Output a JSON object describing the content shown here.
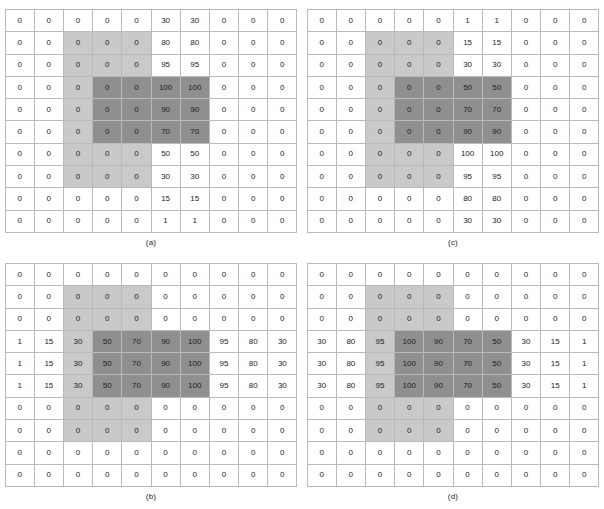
{
  "figure": {
    "title": "",
    "panel_count": 4,
    "grid_rows": 10,
    "grid_cols": 10,
    "colors": {
      "cell_background": "#ffffff",
      "shade_light": "#c9c9c9",
      "shade_dark": "#8f8f8f",
      "grid_line": "#b9b9b9",
      "text": "#1b1b1b"
    }
  },
  "chart_data": {
    "type": "heatmap",
    "title": "",
    "xlabel": "",
    "ylabel": "",
    "grid": true,
    "legend": "none",
    "rows": 10,
    "cols": 10,
    "shading_levels": [
      {
        "name": "none",
        "color": "#ffffff"
      },
      {
        "name": "light",
        "color": "#c9c9c9"
      },
      {
        "name": "dark",
        "color": "#8f8f8f"
      }
    ],
    "shade_regions": {
      "light": {
        "row_start": 1,
        "row_end": 7,
        "col_start": 2,
        "col_end": 4
      },
      "dark": {
        "row_start": 3,
        "row_end": 5,
        "col_start": 3,
        "col_end": 6
      }
    },
    "panels": [
      {
        "label": "(a)",
        "position": "top-left",
        "values": [
          [
            0,
            0,
            0,
            0,
            0,
            30,
            30,
            0,
            0,
            0
          ],
          [
            0,
            0,
            0,
            0,
            0,
            80,
            80,
            0,
            0,
            0
          ],
          [
            0,
            0,
            0,
            0,
            0,
            95,
            95,
            0,
            0,
            0
          ],
          [
            0,
            0,
            0,
            0,
            0,
            100,
            100,
            0,
            0,
            0
          ],
          [
            0,
            0,
            0,
            0,
            0,
            90,
            90,
            0,
            0,
            0
          ],
          [
            0,
            0,
            0,
            0,
            0,
            70,
            70,
            0,
            0,
            0
          ],
          [
            0,
            0,
            0,
            0,
            0,
            50,
            50,
            0,
            0,
            0
          ],
          [
            0,
            0,
            0,
            0,
            0,
            30,
            30,
            0,
            0,
            0
          ],
          [
            0,
            0,
            0,
            0,
            0,
            15,
            15,
            0,
            0,
            0
          ],
          [
            0,
            0,
            0,
            0,
            0,
            1,
            1,
            0,
            0,
            0
          ]
        ]
      },
      {
        "label": "(b)",
        "position": "bottom-left",
        "values": [
          [
            0,
            0,
            0,
            0,
            0,
            0,
            0,
            0,
            0,
            0
          ],
          [
            0,
            0,
            0,
            0,
            0,
            0,
            0,
            0,
            0,
            0
          ],
          [
            0,
            0,
            0,
            0,
            0,
            0,
            0,
            0,
            0,
            0
          ],
          [
            1,
            15,
            30,
            50,
            70,
            90,
            100,
            95,
            80,
            30
          ],
          [
            1,
            15,
            30,
            50,
            70,
            90,
            100,
            95,
            80,
            30
          ],
          [
            1,
            15,
            30,
            50,
            70,
            90,
            100,
            95,
            80,
            30
          ],
          [
            0,
            0,
            0,
            0,
            0,
            0,
            0,
            0,
            0,
            0
          ],
          [
            0,
            0,
            0,
            0,
            0,
            0,
            0,
            0,
            0,
            0
          ],
          [
            0,
            0,
            0,
            0,
            0,
            0,
            0,
            0,
            0,
            0
          ],
          [
            0,
            0,
            0,
            0,
            0,
            0,
            0,
            0,
            0,
            0
          ]
        ]
      },
      {
        "label": "(c)",
        "position": "top-right",
        "values": [
          [
            0,
            0,
            0,
            0,
            0,
            1,
            1,
            0,
            0,
            0
          ],
          [
            0,
            0,
            0,
            0,
            0,
            15,
            15,
            0,
            0,
            0
          ],
          [
            0,
            0,
            0,
            0,
            0,
            30,
            30,
            0,
            0,
            0
          ],
          [
            0,
            0,
            0,
            0,
            0,
            50,
            50,
            0,
            0,
            0
          ],
          [
            0,
            0,
            0,
            0,
            0,
            70,
            70,
            0,
            0,
            0
          ],
          [
            0,
            0,
            0,
            0,
            0,
            90,
            90,
            0,
            0,
            0
          ],
          [
            0,
            0,
            0,
            0,
            0,
            100,
            100,
            0,
            0,
            0
          ],
          [
            0,
            0,
            0,
            0,
            0,
            95,
            95,
            0,
            0,
            0
          ],
          [
            0,
            0,
            0,
            0,
            0,
            80,
            80,
            0,
            0,
            0
          ],
          [
            0,
            0,
            0,
            0,
            0,
            30,
            30,
            0,
            0,
            0
          ]
        ]
      },
      {
        "label": "(d)",
        "position": "bottom-right",
        "values": [
          [
            0,
            0,
            0,
            0,
            0,
            0,
            0,
            0,
            0,
            0
          ],
          [
            0,
            0,
            0,
            0,
            0,
            0,
            0,
            0,
            0,
            0
          ],
          [
            0,
            0,
            0,
            0,
            0,
            0,
            0,
            0,
            0,
            0
          ],
          [
            30,
            80,
            95,
            100,
            90,
            70,
            50,
            30,
            15,
            1
          ],
          [
            30,
            80,
            95,
            100,
            90,
            70,
            50,
            30,
            15,
            1
          ],
          [
            30,
            80,
            95,
            100,
            90,
            70,
            50,
            30,
            15,
            1
          ],
          [
            0,
            0,
            0,
            0,
            0,
            0,
            0,
            0,
            0,
            0
          ],
          [
            0,
            0,
            0,
            0,
            0,
            0,
            0,
            0,
            0,
            0
          ],
          [
            0,
            0,
            0,
            0,
            0,
            0,
            0,
            0,
            0,
            0
          ],
          [
            0,
            0,
            0,
            0,
            0,
            0,
            0,
            0,
            0,
            0
          ]
        ]
      }
    ]
  }
}
